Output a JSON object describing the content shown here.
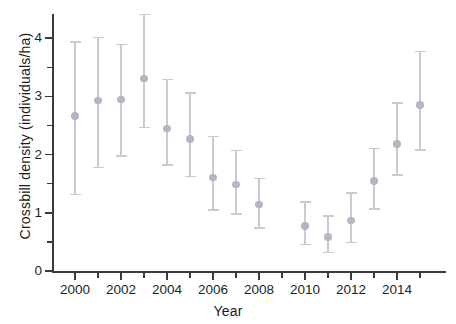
{
  "chart_data": {
    "type": "scatter",
    "title": "",
    "xlabel": "Year",
    "ylabel": "Crossbill density (individuals/ha)",
    "xlim": [
      1999,
      2015.8
    ],
    "ylim": [
      0,
      4.55
    ],
    "grid": false,
    "legend": null,
    "x_ticks": [
      2000,
      2002,
      2004,
      2006,
      2008,
      2010,
      2012,
      2014
    ],
    "x_tick_labels": [
      "2000",
      "2002",
      "2004",
      "2006",
      "2008",
      "2010",
      "2012",
      "2014"
    ],
    "x_minor_ticks": [
      2001,
      2003,
      2005,
      2007,
      2009,
      2011,
      2013,
      2015
    ],
    "y_ticks": [
      0,
      1,
      2,
      3,
      4
    ],
    "y_tick_labels": [
      "0",
      "1",
      "2",
      "3",
      "4"
    ],
    "y_minor_ticks": [
      0.5,
      1.5,
      2.5,
      3.5
    ],
    "marker_color": "#b5b6c4",
    "errorbar_color": "#c9cad4",
    "axis_color": "#3a3a3a",
    "background_color": "#ffffff",
    "points": [
      {
        "x": 2000,
        "y": 2.66,
        "lower": 1.33,
        "upper": 3.95
      },
      {
        "x": 2001,
        "y": 2.93,
        "lower": 1.79,
        "upper": 4.02
      },
      {
        "x": 2002,
        "y": 2.95,
        "lower": 1.99,
        "upper": 3.9
      },
      {
        "x": 2003,
        "y": 3.31,
        "lower": 2.48,
        "upper": 4.42
      },
      {
        "x": 2004,
        "y": 2.45,
        "lower": 1.83,
        "upper": 3.3
      },
      {
        "x": 2005,
        "y": 2.27,
        "lower": 1.64,
        "upper": 3.07
      },
      {
        "x": 2006,
        "y": 1.61,
        "lower": 1.06,
        "upper": 2.32
      },
      {
        "x": 2007,
        "y": 1.49,
        "lower": 0.99,
        "upper": 2.08
      },
      {
        "x": 2008,
        "y": 1.14,
        "lower": 0.75,
        "upper": 1.6
      },
      {
        "x": 2010,
        "y": 0.77,
        "lower": 0.47,
        "upper": 1.2
      },
      {
        "x": 2011,
        "y": 0.58,
        "lower": 0.33,
        "upper": 0.96
      },
      {
        "x": 2012,
        "y": 0.87,
        "lower": 0.5,
        "upper": 1.35
      },
      {
        "x": 2013,
        "y": 1.55,
        "lower": 1.08,
        "upper": 2.12
      },
      {
        "x": 2014,
        "y": 2.18,
        "lower": 1.66,
        "upper": 2.9
      },
      {
        "x": 2015,
        "y": 2.85,
        "lower": 2.09,
        "upper": 3.78
      }
    ]
  },
  "axes": {
    "x_title": "Year",
    "y_title": "Crossbill density (individuals/ha)"
  }
}
